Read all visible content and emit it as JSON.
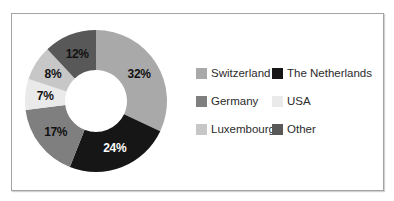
{
  "chart_data": {
    "type": "pie",
    "subtype": "donut",
    "title": "",
    "direction": "clockwise",
    "start_angle_deg": 0,
    "inner_radius_ratio": 0.44,
    "legend_position": "right",
    "legend_columns": 2,
    "segments": [
      {
        "label": "Switzerland",
        "value": 32,
        "display": "32%",
        "color": "#a9a9a9",
        "label_color": "#111111"
      },
      {
        "label": "The Netherlands",
        "value": 24,
        "display": "24%",
        "color": "#161616",
        "label_color": "#ffffff"
      },
      {
        "label": "Germany",
        "value": 17,
        "display": "17%",
        "color": "#7f7f7f",
        "label_color": "#111111"
      },
      {
        "label": "USA",
        "value": 7,
        "display": "7%",
        "color": "#eaeaea",
        "label_color": "#111111"
      },
      {
        "label": "Luxembourg",
        "value": 8,
        "display": "8%",
        "color": "#c7c7c7",
        "label_color": "#111111"
      },
      {
        "label": "Other",
        "value": 12,
        "display": "12%",
        "color": "#585858",
        "label_color": "#111111"
      }
    ]
  },
  "frame": {
    "border_color": "#a3a3a3",
    "background": "#ffffff"
  }
}
